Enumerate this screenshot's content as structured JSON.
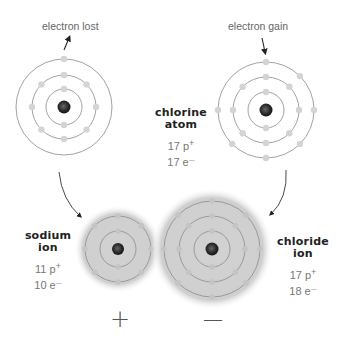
{
  "annotations": {
    "left_top": "electron lost",
    "right_top": "electron gain"
  },
  "chlorine_atom": {
    "name_line1": "chlorine",
    "name_line2": "atom",
    "protons": "17 p",
    "protons_sign": "+",
    "electrons": "17 e",
    "electrons_sign": "—",
    "shells": [
      2,
      8,
      7
    ]
  },
  "sodium_atom": {
    "shells": [
      2,
      8,
      1
    ]
  },
  "sodium_ion": {
    "name_line1": "sodium",
    "name_line2": "ion",
    "protons": "11 p",
    "protons_sign": "+",
    "electrons": "10 e",
    "electrons_sign": "—",
    "charge": "+",
    "shells": [
      2,
      8
    ]
  },
  "chloride_ion": {
    "name_line1": "chloride",
    "name_line2": "ion",
    "protons": "17 p",
    "protons_sign": "+",
    "electrons": "18 e",
    "electrons_sign": "—",
    "charge": "—",
    "shells": [
      2,
      8,
      8
    ]
  },
  "colors": {
    "ring": "#8a8a8a",
    "electron": "#d4d4d4",
    "nucleus": "#333333",
    "ion_glow": "#c8c8c8",
    "arrow": "#333333"
  }
}
